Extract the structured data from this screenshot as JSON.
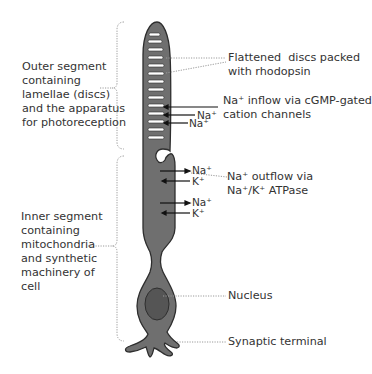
{
  "colors": {
    "cell_fill": "#6f6f6f",
    "cell_outline": "#2e2e2e",
    "nucleus_fill": "#555555",
    "disc_fill": "#ffffff",
    "text": "#333333",
    "leader": "#9a9a9a",
    "arrow": "#111111"
  },
  "left_labels": {
    "outer_segment": "Outer segment\ncontaining\nlamellae (discs)\nand the apparatus\nfor photoreception",
    "inner_segment": "Inner segment\ncontaining\nmitochondria\nand synthetic\nmachinery of\ncell"
  },
  "right_labels": {
    "discs": "Flattened  discs packed\nwith rhodopsin",
    "inflow": "Na⁺ inflow via cGMP-gated\ncation channels",
    "outflow": "Na⁺ outflow via\nNa⁺/K⁺ ATPase",
    "nucleus": "Nucleus",
    "synaptic": "Synaptic terminal"
  },
  "ions": {
    "outer_na_1": "Na⁺",
    "outer_na_2": "Na⁺",
    "inner_na_1": "Na⁺",
    "inner_k_1": "K⁺",
    "inner_na_2": "Na⁺",
    "inner_k_2": "K⁺"
  }
}
